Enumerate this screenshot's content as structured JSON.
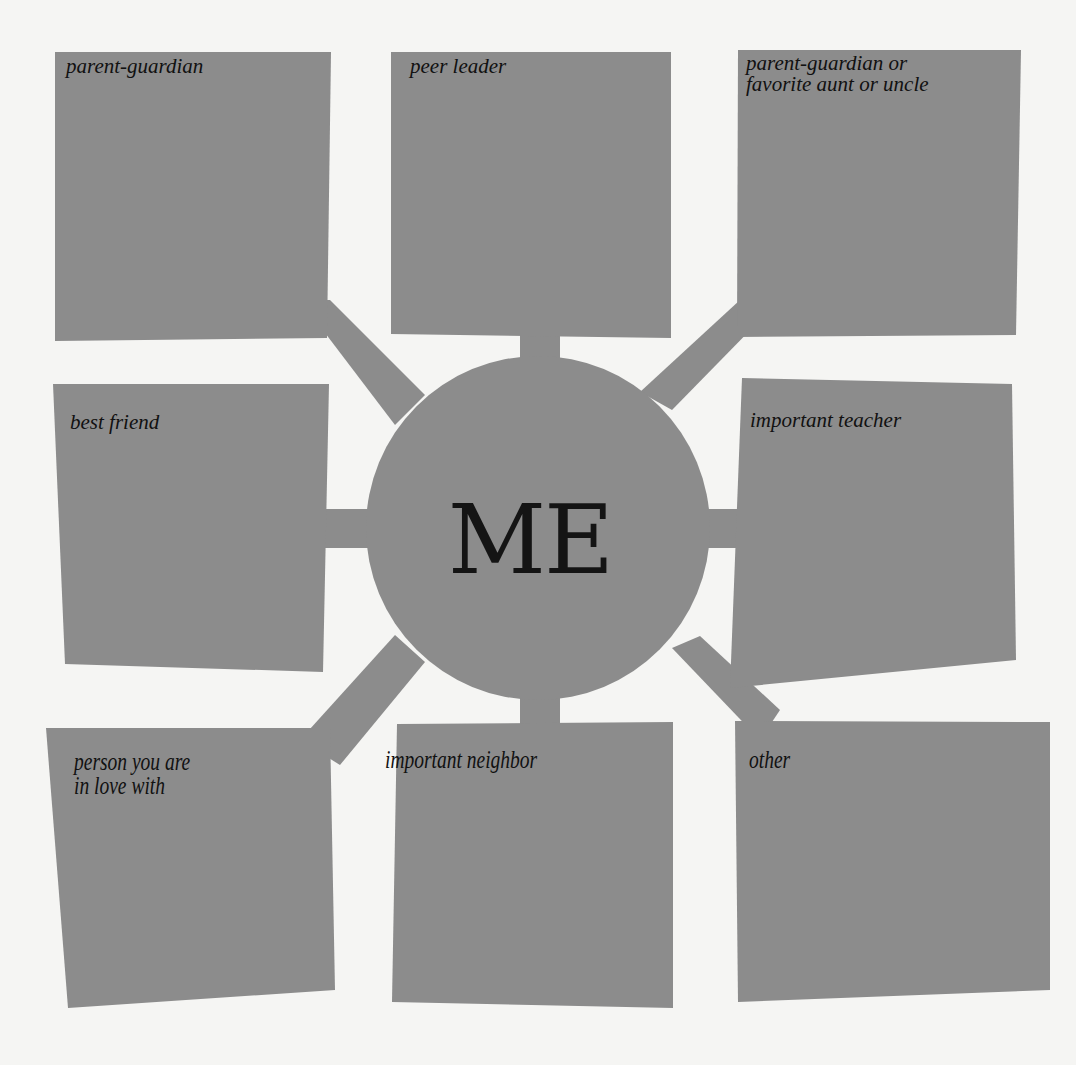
{
  "colors": {
    "background": "#f5f5f3",
    "shape_fill": "#8c8c8c",
    "text": "#111111"
  },
  "center": {
    "label": "ME"
  },
  "boxes": [
    {
      "id": "top-left",
      "label": "parent-guardian"
    },
    {
      "id": "top-center",
      "label": "peer leader"
    },
    {
      "id": "top-right",
      "label": "parent-guardian or\nfavorite aunt or uncle"
    },
    {
      "id": "middle-left",
      "label": "best friend"
    },
    {
      "id": "middle-right",
      "label": "important teacher"
    },
    {
      "id": "bottom-left",
      "label": "person you are\nin love with"
    },
    {
      "id": "bottom-center",
      "label": "important neighbor"
    },
    {
      "id": "bottom-right",
      "label": "other"
    }
  ]
}
